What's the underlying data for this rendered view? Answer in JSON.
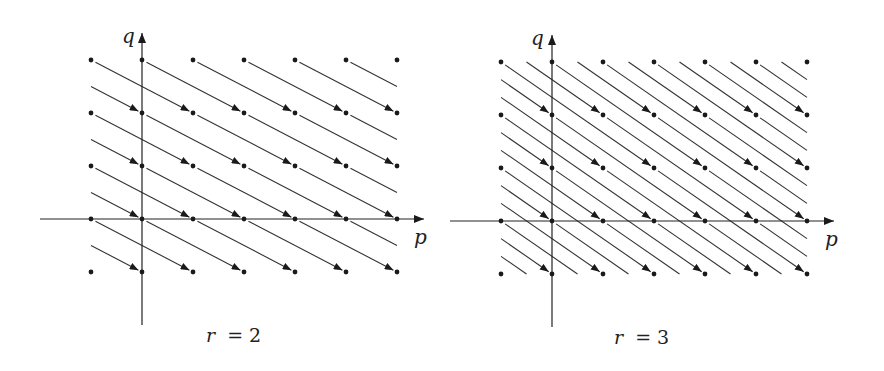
{
  "figure": {
    "line_color": "#333333",
    "dot_color": "#1a1a1a",
    "panels": [
      {
        "id": "r2",
        "caption": "r = 2",
        "caption_var": "r",
        "caption_eq": "= 2",
        "x_axis_label": "p",
        "y_axis_label": "q",
        "origin_px": [
          142,
          219
        ],
        "spacing_px": [
          51,
          53
        ],
        "p_range": [
          -1,
          5
        ],
        "q_range": [
          -1,
          3
        ],
        "step": [
          2,
          -1
        ],
        "x_axis_px": [
          40,
          424
        ],
        "y_axis_px": [
          325,
          33
        ],
        "x_label_px": [
          414,
          244
        ],
        "y_label_px": [
          122,
          43
        ],
        "caption_px": [
          206,
          342
        ]
      },
      {
        "id": "r3",
        "caption": "r = 3",
        "caption_var": "r",
        "caption_eq": "= 3",
        "x_axis_label": "p",
        "y_axis_label": "q",
        "origin_px": [
          552,
          221
        ],
        "spacing_px": [
          51,
          53
        ],
        "p_range": [
          -1,
          5
        ],
        "q_range": [
          -1,
          3
        ],
        "step": [
          3,
          -2
        ],
        "x_axis_px": [
          450,
          834
        ],
        "y_axis_px": [
          327,
          35
        ],
        "x_label_px": [
          825,
          246
        ],
        "y_label_px": [
          531,
          45
        ],
        "caption_px": [
          614,
          344
        ]
      }
    ]
  }
}
